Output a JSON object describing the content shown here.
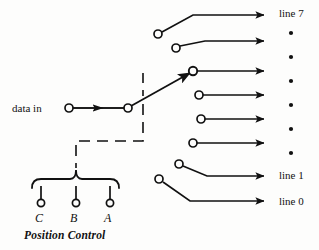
{
  "diagram": {
    "title": "Position Control",
    "type": "demultiplexer-rotary-switch",
    "input": {
      "label": "data in",
      "terminal_x": 69,
      "terminal_y": 108
    },
    "wiper": {
      "pivot_x": 128,
      "pivot_y": 108,
      "tip_x": 193,
      "tip_y": 71,
      "selected_output_index": 5,
      "selected_output_name": "line 5"
    },
    "outputs": [
      {
        "name": "line 7",
        "label": "line 7",
        "show_label": true,
        "terminal_x": 158,
        "terminal_y": 34,
        "knee_x": 193,
        "knee_y": 15,
        "arrow_y": 15
      },
      {
        "name": "line 6",
        "label": "",
        "show_label": false,
        "terminal_x": 176,
        "terminal_y": 48,
        "knee_x": 205,
        "knee_y": 41,
        "arrow_y": 41
      },
      {
        "name": "line 5",
        "label": "",
        "show_label": false,
        "terminal_x": 193,
        "terminal_y": 71,
        "knee_x": 200,
        "knee_y": 71,
        "arrow_y": 71
      },
      {
        "name": "line 4",
        "label": "",
        "show_label": false,
        "terminal_x": 199,
        "terminal_y": 95,
        "knee_x": 205,
        "knee_y": 95,
        "arrow_y": 95
      },
      {
        "name": "line 3",
        "label": "",
        "show_label": false,
        "terminal_x": 201,
        "terminal_y": 119,
        "knee_x": 207,
        "knee_y": 119,
        "arrow_y": 119
      },
      {
        "name": "line 2",
        "label": "",
        "show_label": false,
        "terminal_x": 193,
        "terminal_y": 143,
        "knee_x": 200,
        "knee_y": 143,
        "arrow_y": 143
      },
      {
        "name": "line 1",
        "label": "line 1",
        "show_label": true,
        "terminal_x": 179,
        "terminal_y": 164,
        "knee_x": 207,
        "knee_y": 176,
        "arrow_y": 176
      },
      {
        "name": "line 0",
        "label": "line 0",
        "show_label": true,
        "terminal_x": 159,
        "terminal_y": 179,
        "knee_x": 190,
        "knee_y": 201,
        "arrow_y": 201
      }
    ],
    "arrow_end_x": 273,
    "ellipsis": {
      "name": "vertical-dots",
      "x": 291,
      "count": 6,
      "ys": [
        33,
        57,
        81,
        105,
        129,
        153
      ]
    },
    "select_inputs": [
      {
        "label": "C",
        "x": 41,
        "terminal_y": 203
      },
      {
        "label": "B",
        "x": 76,
        "terminal_y": 203
      },
      {
        "label": "A",
        "x": 110,
        "terminal_y": 203
      }
    ],
    "brace": {
      "left_x": 32,
      "right_x": 119,
      "y": 179,
      "stem_x": 76,
      "stem_top": 168
    },
    "control_path": {
      "description": "dashed link from wiper down and across to the select brace",
      "points": "128,84 128,90 128,130 128,142 76,142 76,168"
    },
    "colors": {
      "ink": "#111111",
      "background": "#fdfdfc"
    }
  }
}
